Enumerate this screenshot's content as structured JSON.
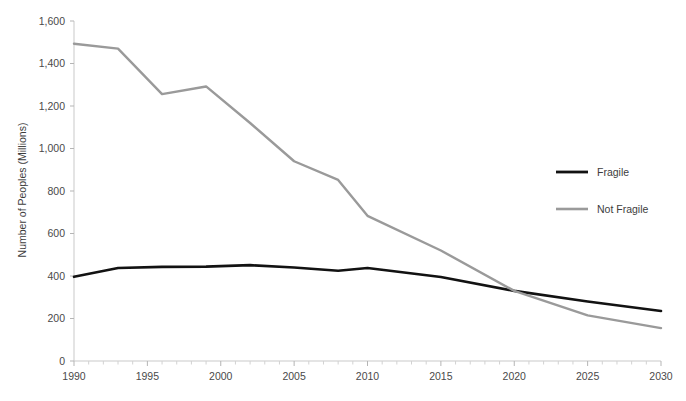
{
  "chart_data": {
    "type": "line",
    "title": "",
    "subtitle": "",
    "xlabel": "",
    "ylabel": "Number of Peoples (Millions)",
    "xlim": [
      1990,
      2030
    ],
    "ylim": [
      0,
      1600
    ],
    "grid": false,
    "legend_position": "right",
    "x_ticks": [
      "1990",
      "1995",
      "2000",
      "2005",
      "2010",
      "2015",
      "2020",
      "2025",
      "2030"
    ],
    "x_tick_values": [
      1990,
      1995,
      2000,
      2005,
      2010,
      2015,
      2020,
      2025,
      2030
    ],
    "x_minor_tick_step": 1,
    "y_ticks": [
      "0",
      "200",
      "400",
      "600",
      "800",
      "1,000",
      "1,200",
      "1,400",
      "1,600"
    ],
    "y_tick_values": [
      0,
      200,
      400,
      600,
      800,
      1000,
      1200,
      1400,
      1600
    ],
    "x": [
      1990,
      1993,
      1996,
      1999,
      2002,
      2005,
      2008,
      2010,
      2015,
      2020,
      2025,
      2030
    ],
    "series": [
      {
        "name": "Fragile",
        "color": "#121212",
        "width": 2.6,
        "values": [
          396,
          438,
          443,
          444,
          451,
          440,
          425,
          438,
          395,
          330,
          280,
          235
        ]
      },
      {
        "name": "Not Fragile",
        "color": "#9a9a9a",
        "width": 2.4,
        "values": [
          1493,
          1470,
          1256,
          1292,
          1120,
          940,
          852,
          683,
          520,
          330,
          215,
          155
        ]
      }
    ],
    "annotations": []
  },
  "legend": {
    "items": [
      {
        "label": "Fragile",
        "color": "#121212"
      },
      {
        "label": "Not Fragile",
        "color": "#9a9a9a"
      }
    ]
  },
  "axes": {
    "y_title": "Number of Peoples (Millions)",
    "axis_color": "#c9c9c9",
    "tick_color": "#b5b5b5",
    "label_color": "#4a4a4a"
  }
}
